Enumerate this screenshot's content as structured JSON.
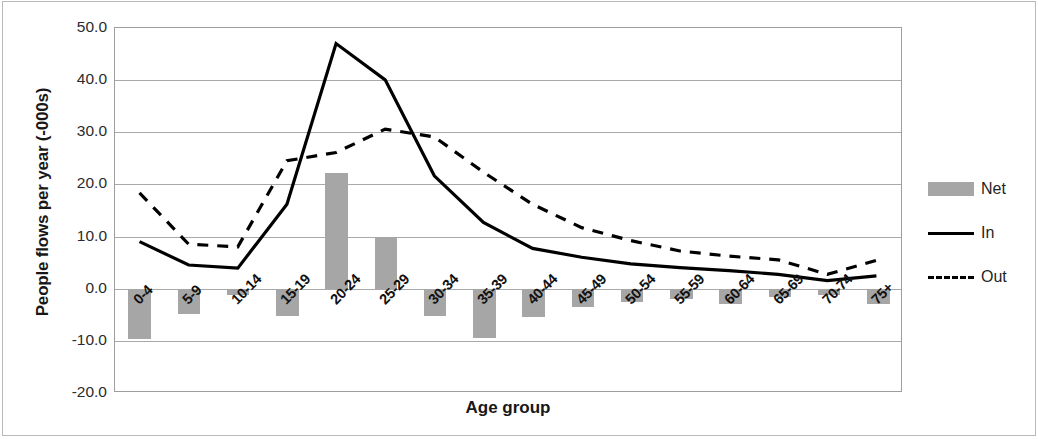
{
  "chart_data": {
    "type": "bar",
    "title": "",
    "xlabel": "Age group",
    "ylabel": "People flows per year (-000s)",
    "ylim": [
      -20.0,
      50.0
    ],
    "ytick_values": [
      50.0,
      40.0,
      30.0,
      20.0,
      10.0,
      0.0,
      -10.0,
      -20.0
    ],
    "ytick_labels": [
      "50.0",
      "40.0",
      "30.0",
      "20.0",
      "10.0",
      "0.0",
      "-10.0",
      "-20.0"
    ],
    "grid": true,
    "legend_position": "right",
    "categories": [
      "0-4",
      "5-9",
      "10-14",
      "15-19",
      "20-24",
      "25-29",
      "30-34",
      "35-39",
      "40-44",
      "45-49",
      "50-54",
      "55-59",
      "60-64",
      "65-69",
      "70-74",
      "75+"
    ],
    "series": [
      {
        "name": "Net",
        "type": "bar",
        "color": "#a6a6a6",
        "values": [
          -9.6,
          -4.8,
          -1.2,
          -5.2,
          22.2,
          10.0,
          -5.3,
          -9.5,
          -5.5,
          -3.6,
          -2.5,
          -2.0,
          -3.0,
          -1.5,
          -1.2,
          -3.0
        ]
      },
      {
        "name": "In",
        "type": "line",
        "style": "solid",
        "color": "#000000",
        "values": [
          8.8,
          4.3,
          3.7,
          16.0,
          47.0,
          40.0,
          21.5,
          12.5,
          7.5,
          5.8,
          4.5,
          3.8,
          3.2,
          2.5,
          1.3,
          2.2
        ]
      },
      {
        "name": "Out",
        "type": "line",
        "style": "dashed",
        "color": "#000000",
        "values": [
          18.2,
          8.3,
          7.8,
          24.4,
          26.0,
          30.5,
          29.0,
          22.2,
          16.0,
          11.5,
          9.0,
          7.0,
          6.0,
          5.3,
          2.5,
          5.2
        ]
      }
    ]
  },
  "legend": {
    "items": [
      {
        "label": "Net",
        "swatch": "bar-swatch-icon"
      },
      {
        "label": "In",
        "swatch": "solid-line-swatch-icon"
      },
      {
        "label": "Out",
        "swatch": "dashed-line-swatch-icon"
      }
    ]
  }
}
